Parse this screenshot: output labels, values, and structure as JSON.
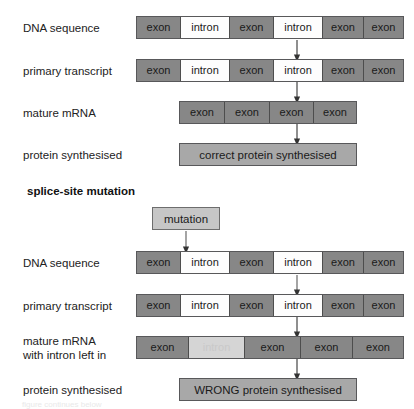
{
  "diagram": {
    "colors": {
      "exon_fill": "#878787",
      "intron_fill": "#fdfdfd",
      "intron_faded_fill": "#d5d5d5",
      "protein_fill": "#a8a8a8",
      "mutation_fill": "#c6c6c6",
      "border": "#58585a",
      "arrow": "#333333"
    },
    "labels": {
      "exon": "exon",
      "intron": "intron"
    },
    "section_heading": "splice-site mutation",
    "mutation_box_label": "mutation",
    "bottom_partial_text": "figure continues below"
  },
  "normal_pathway": {
    "rows": [
      {
        "label": "DNA sequence",
        "segments": [
          {
            "type": "exon",
            "text": "exon"
          },
          {
            "type": "intron",
            "text": "intron"
          },
          {
            "type": "exon",
            "text": "exon"
          },
          {
            "type": "intron",
            "text": "intron"
          },
          {
            "type": "exon",
            "text": "exon"
          },
          {
            "type": "exon",
            "text": "exon"
          }
        ]
      },
      {
        "label": "primary transcript",
        "segments": [
          {
            "type": "exon",
            "text": "exon"
          },
          {
            "type": "intron",
            "text": "intron"
          },
          {
            "type": "exon",
            "text": "exon"
          },
          {
            "type": "intron",
            "text": "intron"
          },
          {
            "type": "exon",
            "text": "exon"
          },
          {
            "type": "exon",
            "text": "exon"
          }
        ]
      },
      {
        "label": "mature mRNA",
        "segments": [
          {
            "type": "exon",
            "text": "exon"
          },
          {
            "type": "exon",
            "text": "exon"
          },
          {
            "type": "exon",
            "text": "exon"
          },
          {
            "type": "exon",
            "text": "exon"
          }
        ]
      }
    ],
    "protein_label": "protein synthesised",
    "protein_result": "correct protein synthesised"
  },
  "mutant_pathway": {
    "rows": [
      {
        "label": "DNA sequence",
        "segments": [
          {
            "type": "exon",
            "text": "exon"
          },
          {
            "type": "intron",
            "text": "intron"
          },
          {
            "type": "exon",
            "text": "exon"
          },
          {
            "type": "intron",
            "text": "intron"
          },
          {
            "type": "exon",
            "text": "exon"
          },
          {
            "type": "exon",
            "text": "exon"
          }
        ]
      },
      {
        "label": "primary transcript",
        "segments": [
          {
            "type": "exon",
            "text": "exon"
          },
          {
            "type": "intron",
            "text": "intron"
          },
          {
            "type": "exon",
            "text": "exon"
          },
          {
            "type": "intron",
            "text": "intron"
          },
          {
            "type": "exon",
            "text": "exon"
          },
          {
            "type": "exon",
            "text": "exon"
          }
        ]
      },
      {
        "label": "mature mRNA\nwith intron left in",
        "segments": [
          {
            "type": "exon",
            "text": "exon"
          },
          {
            "type": "intron-faded",
            "text": "intron"
          },
          {
            "type": "exon",
            "text": "exon"
          },
          {
            "type": "exon",
            "text": "exon"
          },
          {
            "type": "exon",
            "text": "exon"
          }
        ]
      }
    ],
    "protein_label": "protein synthesised",
    "protein_result": "WRONG protein synthesised"
  }
}
